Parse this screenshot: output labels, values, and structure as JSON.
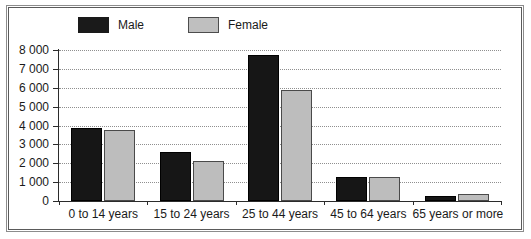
{
  "chart_data": {
    "type": "bar",
    "title": "",
    "xlabel": "",
    "ylabel": "",
    "ylim": [
      0,
      8000
    ],
    "yticks": [
      "0",
      "1 000",
      "2 000",
      "3 000",
      "4 000",
      "5 000",
      "6 000",
      "7 000",
      "8 000"
    ],
    "grid": true,
    "legend_position": "top-left",
    "categories": [
      "0 to 14 years",
      "15 to 24 years",
      "25 to 44 years",
      "45 to 64 years",
      "65 years or more"
    ],
    "series": [
      {
        "name": "Male",
        "color": "#161616",
        "values": [
          3860,
          2590,
          7730,
          1270,
          270
        ]
      },
      {
        "name": "Female",
        "color": "#bdbdbd",
        "values": [
          3760,
          2120,
          5870,
          1270,
          380
        ]
      }
    ]
  },
  "legend": {
    "entries": [
      {
        "label": "Male",
        "swatch": "black-square-swatch"
      },
      {
        "label": "Female",
        "swatch": "gray-square-swatch"
      }
    ]
  },
  "colors": {
    "male": "#161616",
    "female": "#bdbdbd",
    "gridline": "#8f8f8f",
    "axis": "#2b2b2b",
    "frame": "#5a5a5a",
    "background": "#ffffff"
  }
}
